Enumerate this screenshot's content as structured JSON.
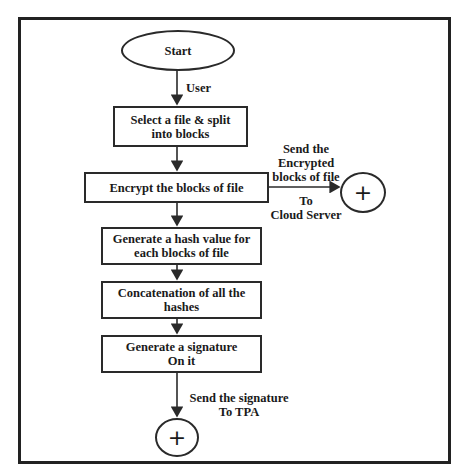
{
  "diagram": {
    "type": "flowchart",
    "start": {
      "label": "Start"
    },
    "edges": {
      "start_to_select": "User",
      "encrypt_to_cloud_top": [
        "Send the",
        "Encrypted",
        "blocks of file"
      ],
      "encrypt_to_cloud_bottom": [
        "To",
        "Cloud Server"
      ],
      "signature_to_tpa": [
        "Send the signature",
        "To TPA"
      ]
    },
    "steps": [
      {
        "id": "select",
        "lines": [
          "Select a file & split",
          "into blocks"
        ]
      },
      {
        "id": "encrypt",
        "lines": [
          "Encrypt the blocks of file"
        ]
      },
      {
        "id": "hash",
        "lines": [
          "Generate a hash value for",
          "each blocks of file"
        ]
      },
      {
        "id": "concat",
        "lines": [
          "Concatenation of all the",
          "hashes"
        ]
      },
      {
        "id": "signature",
        "lines": [
          "Generate a signature",
          "On it"
        ]
      }
    ],
    "connectors": [
      {
        "id": "cloud-connector",
        "symbol": "+"
      },
      {
        "id": "tpa-connector",
        "symbol": "+"
      }
    ]
  }
}
